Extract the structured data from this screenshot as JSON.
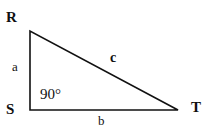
{
  "diagram": {
    "type": "right-triangle",
    "vertices": [
      {
        "label": "R",
        "x": 30,
        "y": 31
      },
      {
        "label": "S",
        "x": 30,
        "y": 110
      },
      {
        "label": "T",
        "x": 178,
        "y": 110
      }
    ],
    "sides": [
      {
        "label": "a",
        "from": "R",
        "to": "S"
      },
      {
        "label": "b",
        "from": "S",
        "to": "T"
      },
      {
        "label": "c",
        "from": "R",
        "to": "T"
      }
    ],
    "right_angle": {
      "vertex": "S",
      "label": "90°"
    },
    "colors": {
      "stroke": "#111111",
      "background": "#ffffff"
    }
  }
}
